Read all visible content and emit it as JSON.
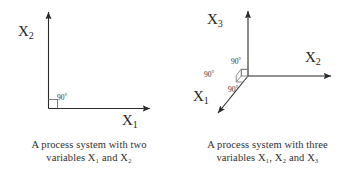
{
  "figure": {
    "background_color": "#ffffff",
    "stroke_color": "#2b2b2b",
    "panels": [
      {
        "id": "two-variable",
        "caption_line_1": "A process system with two",
        "caption_line_2": "variables X₁ and X₂",
        "axes": [
          {
            "name": "x2-axis",
            "label_base": "X",
            "label_sub": "2",
            "direction": "up"
          },
          {
            "name": "x1-axis",
            "label_base": "X",
            "label_sub": "1",
            "direction": "right"
          }
        ],
        "angles": [
          {
            "name": "right-angle-origin",
            "value": "90",
            "unit": "°"
          }
        ]
      },
      {
        "id": "three-variable",
        "caption_line_1": "A process system with three",
        "caption_line_2": "variables X₁, X₂ and X₃",
        "axes": [
          {
            "name": "x3-axis",
            "label_base": "X",
            "label_sub": "3",
            "direction": "up"
          },
          {
            "name": "x2-axis",
            "label_base": "X",
            "label_sub": "2",
            "direction": "right"
          },
          {
            "name": "x1-axis",
            "label_base": "X",
            "label_sub": "1",
            "direction": "down-left"
          }
        ],
        "angles": [
          {
            "name": "right-angle-top",
            "value": "90",
            "unit": "°"
          },
          {
            "name": "right-angle-left",
            "value": "90",
            "unit": "°"
          },
          {
            "name": "right-angle-bottom",
            "value": "90",
            "unit": "°"
          }
        ]
      }
    ]
  }
}
